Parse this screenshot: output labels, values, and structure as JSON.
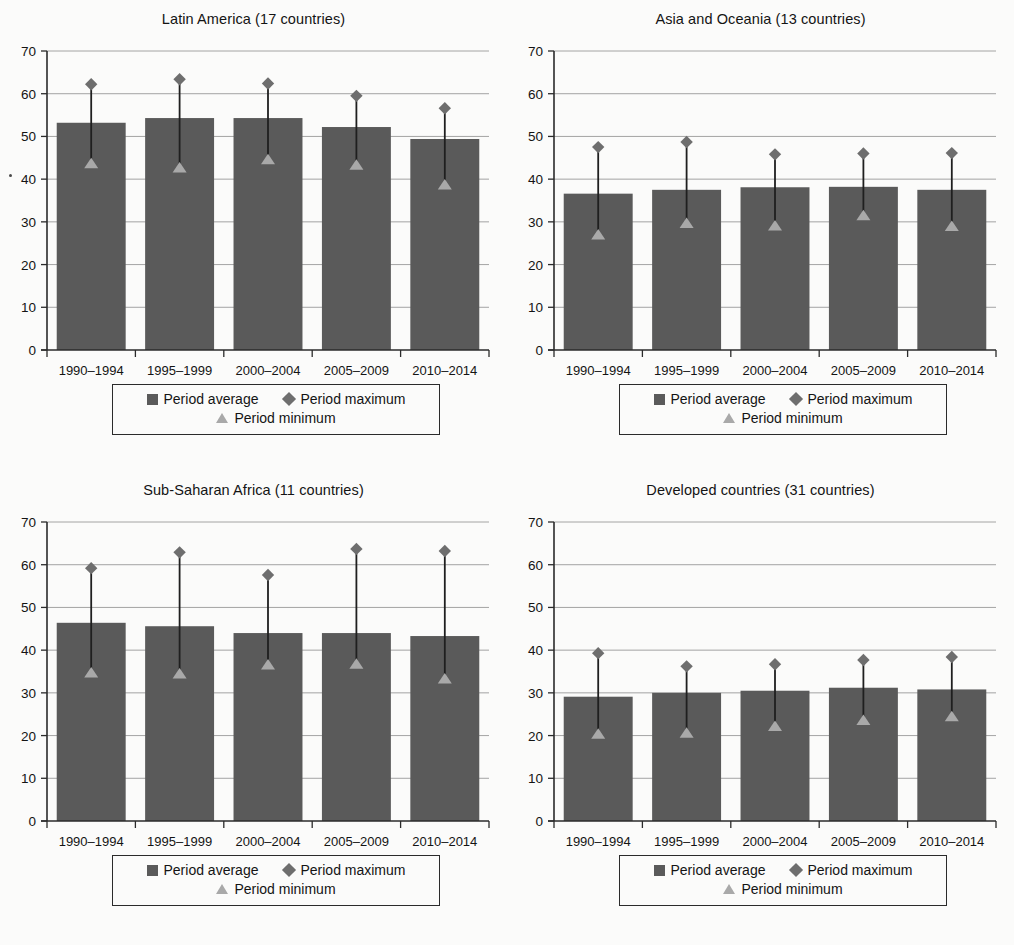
{
  "page": {
    "background_color": "#fbfbfa",
    "bar_color": "#5a5a5a",
    "max_marker_color": "#6e6e6e",
    "min_marker_color": "#a9a9a9",
    "connector_color": "#1f1f1f",
    "grid_color": "#9a9a9a",
    "axis_color": "#2b2b2b"
  },
  "legend": {
    "average_label": "Period average",
    "maximum_label": "Period maximum",
    "minimum_label": "Period minimum",
    "average_icon": "filled-square-icon",
    "maximum_icon": "diamond-icon",
    "minimum_icon": "triangle-icon"
  },
  "axis": {
    "y_ticks": [
      0,
      10,
      20,
      30,
      40,
      50,
      60,
      70
    ],
    "ylim": [
      0,
      70
    ],
    "categories": [
      "1990–1994",
      "1995–1999",
      "2000–2004",
      "2005–2009",
      "2010–2014"
    ]
  },
  "chart_data": [
    {
      "id": "latin-america",
      "type": "bar",
      "title": "Latin America (17 countries)",
      "xlabel": "",
      "ylabel": "",
      "ylim": [
        0,
        70
      ],
      "grid": true,
      "legend_position": "bottom",
      "categories": [
        "1990–1994",
        "1995–1999",
        "2000–2004",
        "2005–2009",
        "2010–2014"
      ],
      "series": [
        {
          "name": "Period average",
          "values": [
            53.2,
            54.3,
            54.3,
            52.2,
            49.4
          ]
        },
        {
          "name": "Period maximum",
          "values": [
            62.2,
            63.4,
            62.4,
            59.5,
            56.6
          ]
        },
        {
          "name": "Period minimum",
          "values": [
            43.8,
            42.8,
            44.7,
            43.4,
            38.8
          ]
        }
      ]
    },
    {
      "id": "asia-and-oceania",
      "type": "bar",
      "title": "Asia and Oceania (13 countries)",
      "xlabel": "",
      "ylabel": "",
      "ylim": [
        0,
        70
      ],
      "grid": true,
      "legend_position": "bottom",
      "categories": [
        "1990–1994",
        "1995–1999",
        "2000–2004",
        "2005–2009",
        "2010–2014"
      ],
      "series": [
        {
          "name": "Period average",
          "values": [
            36.6,
            37.5,
            38.1,
            38.2,
            37.5
          ]
        },
        {
          "name": "Period maximum",
          "values": [
            47.5,
            48.7,
            45.8,
            46.0,
            46.1
          ]
        },
        {
          "name": "Period minimum",
          "values": [
            27.1,
            29.8,
            29.2,
            31.6,
            29.1
          ]
        }
      ]
    },
    {
      "id": "sub-saharan-africa",
      "type": "bar",
      "title": "Sub-Saharan Africa (11 countries)",
      "xlabel": "",
      "ylabel": "",
      "ylim": [
        0,
        70
      ],
      "grid": true,
      "legend_position": "bottom",
      "categories": [
        "1990–1994",
        "1995–1999",
        "2000–2004",
        "2005–2009",
        "2010–2014"
      ],
      "series": [
        {
          "name": "Period average",
          "values": [
            46.4,
            45.6,
            44.0,
            44.0,
            43.3
          ]
        },
        {
          "name": "Period maximum",
          "values": [
            59.2,
            62.9,
            57.6,
            63.7,
            63.2
          ]
        },
        {
          "name": "Period minimum",
          "values": [
            34.8,
            34.6,
            36.7,
            36.9,
            33.4
          ]
        }
      ]
    },
    {
      "id": "developed-countries",
      "type": "bar",
      "title": "Developed countries (31 countries)",
      "xlabel": "",
      "ylabel": "",
      "ylim": [
        0,
        70
      ],
      "grid": true,
      "legend_position": "bottom",
      "categories": [
        "1990–1994",
        "1995–1999",
        "2000–2004",
        "2005–2009",
        "2010–2014"
      ],
      "series": [
        {
          "name": "Period average",
          "values": [
            29.1,
            30.0,
            30.5,
            31.2,
            30.8
          ]
        },
        {
          "name": "Period maximum",
          "values": [
            39.3,
            36.2,
            36.7,
            37.7,
            38.4
          ]
        },
        {
          "name": "Period minimum",
          "values": [
            20.5,
            20.7,
            22.3,
            23.7,
            24.6
          ]
        }
      ]
    }
  ]
}
